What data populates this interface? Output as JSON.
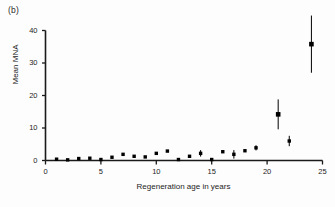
{
  "figure": {
    "panel_label": "(b)",
    "background_color": "#ffffff",
    "marker_color": "#000000",
    "axis_color": "#1a1a1a"
  },
  "chart_data": {
    "type": "scatter",
    "title": "",
    "subtitle": "",
    "xlabel": "Regeneration age in years",
    "ylabel": "Mean MNA",
    "xlim": [
      0,
      25
    ],
    "ylim": [
      0,
      40
    ],
    "xticks": [
      0,
      5,
      10,
      15,
      20,
      25
    ],
    "xtick_labels": [
      "0",
      "5",
      "10",
      "15",
      "20",
      "25"
    ],
    "yticks": [
      0,
      10,
      20,
      30,
      40
    ],
    "ytick_labels": [
      "0",
      "10",
      "20",
      "30",
      "40"
    ],
    "grid": false,
    "legend": null,
    "legend_position": "none",
    "marker": "square",
    "error_bars": "vertical",
    "series": [
      {
        "name": "Mean MNA",
        "points": [
          {
            "x": 1,
            "y": 0.4,
            "err": 0.0
          },
          {
            "x": 2,
            "y": 0.2,
            "err": 0.0
          },
          {
            "x": 3,
            "y": 0.6,
            "err": 0.0
          },
          {
            "x": 4,
            "y": 0.7,
            "err": 0.0
          },
          {
            "x": 5,
            "y": 0.3,
            "err": 0.0
          },
          {
            "x": 6,
            "y": 1.0,
            "err": 0.0
          },
          {
            "x": 7,
            "y": 1.9,
            "err": 0.0
          },
          {
            "x": 8,
            "y": 1.3,
            "err": 0.3
          },
          {
            "x": 9,
            "y": 1.1,
            "err": 0.0
          },
          {
            "x": 10,
            "y": 2.2,
            "err": 0.0
          },
          {
            "x": 11,
            "y": 2.9,
            "err": 0.0
          },
          {
            "x": 12,
            "y": 0.3,
            "err": 0.0
          },
          {
            "x": 13,
            "y": 1.3,
            "err": 0.0
          },
          {
            "x": 14,
            "y": 2.2,
            "err": 1.0
          },
          {
            "x": 15,
            "y": 0.3,
            "err": 0.0
          },
          {
            "x": 16,
            "y": 2.7,
            "err": 0.0
          },
          {
            "x": 17,
            "y": 1.9,
            "err": 1.3
          },
          {
            "x": 18,
            "y": 3.0,
            "err": 0.0
          },
          {
            "x": 19,
            "y": 3.9,
            "err": 0.8
          },
          {
            "x": 21,
            "y": 14.2,
            "err": 4.6
          },
          {
            "x": 22,
            "y": 6.0,
            "err": 1.6
          },
          {
            "x": 24,
            "y": 35.8,
            "err": 8.8
          }
        ]
      }
    ]
  }
}
